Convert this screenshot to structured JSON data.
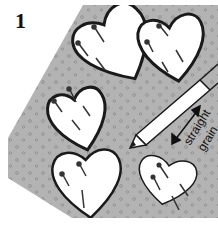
{
  "figure": {
    "step_number": "1",
    "grain_label_line1": "straight",
    "grain_label_line2": "grain",
    "colors": {
      "fabric": "#b3b3b3",
      "fabric_dots": "#8a8a8a",
      "outline": "#1a1a1a",
      "heart_fill": "#ffffff",
      "background": "#ffffff"
    },
    "elements": {
      "fabric": "dotted gray fabric piece",
      "hearts": 5,
      "traced_hearts": 3,
      "tool": "pencil tracing around heart template",
      "arrow": "double-headed straight grain arrow"
    }
  }
}
